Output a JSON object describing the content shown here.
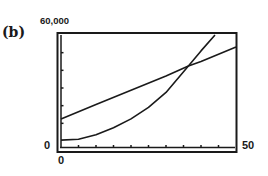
{
  "figure": {
    "part_label": "(b)",
    "y_max_label": "60,000",
    "y_min_label": "0",
    "x_min_label": "0",
    "x_max_label": "50"
  },
  "colors": {
    "ink": "#1a1a1a",
    "background": "#ffffff"
  },
  "chart_data": {
    "type": "line",
    "title": "(b)",
    "xlabel": "",
    "ylabel": "",
    "xlim": [
      0,
      50
    ],
    "ylim": [
      0,
      60000
    ],
    "x_tick_step": 5,
    "y_tick_step": 10000,
    "grid": false,
    "legend": null,
    "tick_labels": {
      "x": [
        "0",
        "50"
      ],
      "y": [
        "0",
        "60,000"
      ]
    },
    "series": [
      {
        "name": "linear",
        "x": [
          0,
          10,
          20,
          30,
          36.4,
          40,
          50
        ],
        "values": [
          12450,
          20600,
          28700,
          36800,
          42450,
          45000,
          53200
        ]
      },
      {
        "name": "quadratic",
        "x": [
          0,
          5,
          10,
          15,
          20,
          25,
          30,
          36.4,
          40,
          44
        ],
        "values": [
          500,
          1000,
          3500,
          7500,
          12500,
          19000,
          27500,
          42450,
          51000,
          60000
        ]
      }
    ],
    "annotations": [
      {
        "type": "intersection",
        "x": 36.4,
        "y": 42450
      }
    ]
  }
}
